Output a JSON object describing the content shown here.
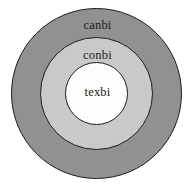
{
  "diagram": {
    "type": "concentric-circles",
    "background_color": "#ffffff",
    "rings": [
      {
        "name": "outer",
        "label": "canbi",
        "fill_color": "#919191",
        "stroke_color": "#1c1c1c",
        "diameter_px": 171
      },
      {
        "name": "middle",
        "label": "conbi",
        "fill_color": "#c9c9c9",
        "stroke_color": "#1c1c1c",
        "diameter_px": 113
      },
      {
        "name": "inner",
        "label": "texbi",
        "fill_color": "#fdfdfd",
        "stroke_color": "#1c1c1c",
        "diameter_px": 63
      }
    ]
  }
}
